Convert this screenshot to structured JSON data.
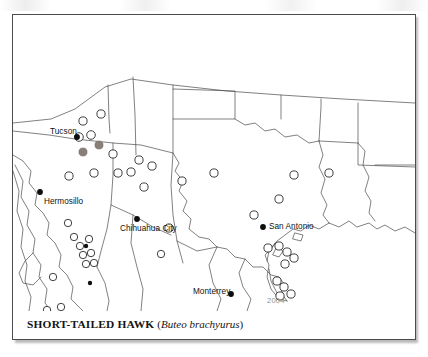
{
  "plate": {
    "caption_common": "SHORT-TAILED HAWK",
    "caption_open_paren": "(",
    "caption_scientific": "Buteo brachyurus",
    "caption_close_paren": ")"
  },
  "colors": {
    "coastline": "#4a4a4a",
    "border": "#4c4c4c",
    "open_circle_stroke": "#2a2a2a",
    "filled_city_dot": "#0d0d0d",
    "gray_record": "#8a7f78",
    "water_label": "#8d9488",
    "page_background": "#ffffff"
  },
  "map": {
    "type": "distribution-range-map",
    "projection_note": "southwestern United States and northern Mexico",
    "cities": [
      {
        "name": "Tucson",
        "label_x": 37,
        "label_y": 112,
        "dot_x": 64,
        "dot_y": 122,
        "anchor": "right"
      },
      {
        "name": "Hermosillo",
        "label_x": 31,
        "label_y": 187,
        "dot_x": 27,
        "dot_y": 177,
        "anchor": "left"
      },
      {
        "name": "Chihuahua City",
        "label_x": 107,
        "label_y": 214,
        "dot_x": 124,
        "dot_y": 204,
        "anchor": "left"
      },
      {
        "name": "San Antonio",
        "label_x": 256,
        "label_y": 210,
        "dot_x": 250,
        "dot_y": 212,
        "anchor": "left"
      },
      {
        "name": "Monterrey",
        "label_x": 180,
        "label_y": 276,
        "dot_x": 218,
        "dot_y": 279,
        "anchor": "left"
      }
    ],
    "water_labels": [
      {
        "name": "2004",
        "label_x": 254,
        "label_y": 286
      }
    ],
    "record_points_open": [
      {
        "x": 70,
        "y": 106
      },
      {
        "x": 88,
        "y": 99
      },
      {
        "x": 78,
        "y": 120
      },
      {
        "x": 56,
        "y": 161
      },
      {
        "x": 81,
        "y": 158
      },
      {
        "x": 105,
        "y": 158
      },
      {
        "x": 100,
        "y": 139
      },
      {
        "x": 126,
        "y": 145
      },
      {
        "x": 118,
        "y": 157
      },
      {
        "x": 139,
        "y": 151
      },
      {
        "x": 131,
        "y": 172
      },
      {
        "x": 156,
        "y": 213
      },
      {
        "x": 169,
        "y": 166
      },
      {
        "x": 201,
        "y": 158
      },
      {
        "x": 241,
        "y": 200
      },
      {
        "x": 266,
        "y": 184
      },
      {
        "x": 281,
        "y": 160
      },
      {
        "x": 316,
        "y": 158
      },
      {
        "x": 255,
        "y": 233
      },
      {
        "x": 266,
        "y": 231
      },
      {
        "x": 274,
        "y": 237
      },
      {
        "x": 281,
        "y": 243
      },
      {
        "x": 272,
        "y": 249
      },
      {
        "x": 264,
        "y": 266
      },
      {
        "x": 271,
        "y": 272
      },
      {
        "x": 278,
        "y": 279
      },
      {
        "x": 267,
        "y": 281
      },
      {
        "x": 61,
        "y": 222
      },
      {
        "x": 67,
        "y": 231
      },
      {
        "x": 76,
        "y": 224
      },
      {
        "x": 70,
        "y": 240
      },
      {
        "x": 78,
        "y": 238
      },
      {
        "x": 73,
        "y": 249
      },
      {
        "x": 81,
        "y": 248
      },
      {
        "x": 55,
        "y": 208
      },
      {
        "x": 40,
        "y": 262
      },
      {
        "x": 34,
        "y": 295
      },
      {
        "x": 56,
        "y": 303
      },
      {
        "x": 48,
        "y": 292
      },
      {
        "x": 148,
        "y": 239
      }
    ],
    "record_points_gray": [
      {
        "x": 70,
        "y": 137
      },
      {
        "x": 86,
        "y": 130
      },
      {
        "x": 66,
        "y": 119
      }
    ],
    "record_points_black": [
      {
        "x": 77,
        "y": 268
      },
      {
        "x": 73,
        "y": 231
      }
    ]
  }
}
